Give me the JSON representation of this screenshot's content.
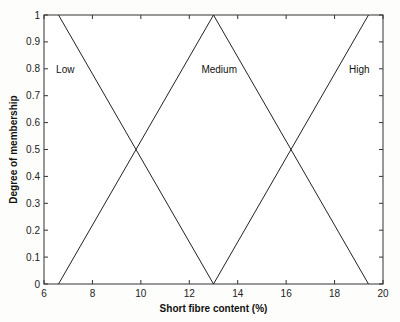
{
  "chart_data": {
    "type": "line",
    "title": "",
    "xlabel": "Short fibre content (%)",
    "ylabel": "Degree of membership",
    "xlim": [
      6,
      20
    ],
    "ylim": [
      0,
      1
    ],
    "xticks": [
      "6",
      "8",
      "10",
      "12",
      "14",
      "16",
      "18",
      "20"
    ],
    "yticks": [
      "0",
      "0.1",
      "0.2",
      "0.3",
      "0.4",
      "0.5",
      "0.6",
      "0.7",
      "0.8",
      "0.9",
      "1"
    ],
    "grid": false,
    "series": [
      {
        "name": "Low",
        "x": [
          6.6,
          13
        ],
        "y": [
          1,
          0
        ]
      },
      {
        "name": "Medium",
        "x": [
          6.6,
          13,
          19.4
        ],
        "y": [
          0,
          1,
          0
        ]
      },
      {
        "name": "High",
        "x": [
          13,
          19.4
        ],
        "y": [
          0,
          1
        ]
      }
    ],
    "annotations": [
      {
        "text": "Low",
        "x": 6.5,
        "y": 0.8
      },
      {
        "text": "Medium",
        "x": 12.5,
        "y": 0.8
      },
      {
        "text": "High",
        "x": 18.6,
        "y": 0.8
      }
    ]
  }
}
